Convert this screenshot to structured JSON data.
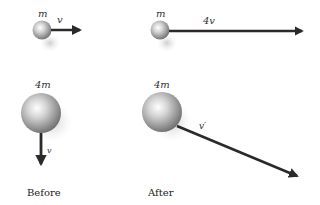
{
  "diagram": {
    "colors": {
      "arrow": "#2a2a2a",
      "ball_light": "#ffffff",
      "ball_dark": "#8a8a8a",
      "shadow": "#d8d8d8",
      "text": "#333333"
    },
    "before": {
      "caption": "Before",
      "small_ball": {
        "mass_label": "m",
        "velocity_label": "v",
        "direction": "right"
      },
      "large_ball": {
        "mass_label": "4m",
        "velocity_label": "v",
        "direction": "down"
      }
    },
    "after": {
      "caption": "After",
      "small_ball": {
        "mass_label": "m",
        "velocity_label": "4v",
        "direction": "right"
      },
      "large_ball": {
        "mass_label": "4m",
        "velocity_label": "v′",
        "direction": "down-right"
      }
    }
  }
}
